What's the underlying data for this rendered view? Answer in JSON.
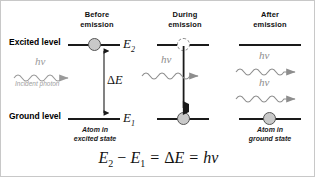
{
  "figure": {
    "background": "#ffffff",
    "border_color": "#c8c8c8"
  },
  "columns": [
    {
      "id": "before",
      "line1": "Before",
      "line2": "emission"
    },
    {
      "id": "during",
      "line1": "During",
      "line2": "emission"
    },
    {
      "id": "after",
      "line1": "After",
      "line2": "emission"
    }
  ],
  "levels": [
    {
      "id": "excited",
      "label": "Excited level",
      "symbol": "E",
      "subscript": "2"
    },
    {
      "id": "ground",
      "label": "Ground level",
      "symbol": "E",
      "subscript": "1"
    }
  ],
  "gap": {
    "label_delta": "Δ",
    "label_symbol": "E"
  },
  "photons": [
    {
      "id": "incident",
      "column": "before",
      "label": "hν",
      "caption": "Incident photon",
      "color": "#9a9a9a"
    },
    {
      "id": "stimulating",
      "column": "during",
      "label": "hν",
      "caption": "",
      "color": "#8d8d8d"
    },
    {
      "id": "emitted-1",
      "column": "after",
      "label": "hν",
      "caption": "",
      "color": "#8d8d8d"
    },
    {
      "id": "emitted-2",
      "column": "after",
      "label": "hν",
      "caption": "",
      "color": "#8d8d8d"
    }
  ],
  "atoms": [
    {
      "id": "before-excited",
      "column": "before",
      "level": "excited",
      "style": "filled",
      "caption_line1": "Atom in",
      "caption_line2": "excited state"
    },
    {
      "id": "during-excited",
      "column": "during",
      "level": "excited",
      "style": "dashed",
      "caption_line1": "",
      "caption_line2": ""
    },
    {
      "id": "during-ground",
      "column": "during",
      "level": "ground",
      "style": "filled",
      "caption_line1": "",
      "caption_line2": ""
    },
    {
      "id": "after-ground",
      "column": "after",
      "level": "ground",
      "style": "filled",
      "caption_line1": "Atom in",
      "caption_line2": "ground state"
    }
  ],
  "equation": {
    "text": "E₂ − E₁ = ΔE = hν",
    "parts": {
      "e2": "E",
      "e2_sub": "2",
      "minus": "−",
      "e1": "E",
      "e1_sub": "1",
      "equals": "=",
      "delta": "ΔE",
      "hv": "hν"
    }
  },
  "colors": {
    "atom_fill": "#c9c9c9",
    "atom_stroke": "#555555",
    "level_line": "#1a1a1a",
    "photon_gray": "#9a9a9a",
    "text": "#111111"
  }
}
